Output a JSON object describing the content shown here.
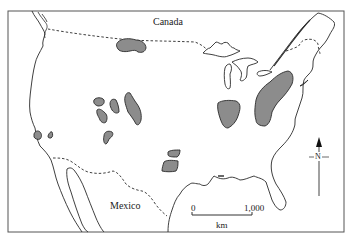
{
  "map": {
    "type": "thematic region map",
    "colors": {
      "background": "#ffffff",
      "outline": "#2a2a2a",
      "shaded_region": "#8c8c8c",
      "frame": "#555555"
    },
    "labels": {
      "canada": "Canada",
      "mexico": "Mexico"
    },
    "scale_bar": {
      "start": "0",
      "end": "1,000",
      "unit": "km"
    },
    "north_arrow": {
      "label": "N"
    },
    "shaded_regions": [
      {
        "name": "northern-plains-region"
      },
      {
        "name": "great-basin-region-1"
      },
      {
        "name": "great-basin-region-2"
      },
      {
        "name": "great-basin-region-3"
      },
      {
        "name": "great-basin-region-4"
      },
      {
        "name": "rocky-mountain-region"
      },
      {
        "name": "southern-california-region-1"
      },
      {
        "name": "southern-california-region-2"
      },
      {
        "name": "southern-plains-region-1"
      },
      {
        "name": "southern-plains-region-2"
      },
      {
        "name": "midwest-region"
      },
      {
        "name": "appalachian-region"
      }
    ]
  }
}
